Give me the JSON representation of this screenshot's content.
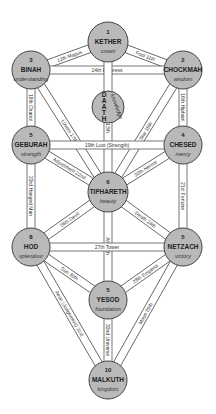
{
  "sephiroth": [
    {
      "id": "kether",
      "number": "1",
      "name": "KETHER",
      "quality": "crown",
      "cx": 108,
      "cy": 42,
      "r": 20
    },
    {
      "id": "chockmah",
      "number": "2",
      "name": "CHOCKMAH",
      "quality": "wisdom",
      "cx": 183,
      "cy": 70,
      "r": 19
    },
    {
      "id": "binah",
      "number": "3",
      "name": "BINAH",
      "quality": "understanding",
      "cx": 31,
      "cy": 70,
      "r": 19
    },
    {
      "id": "daath",
      "number": "",
      "name": "DAATH",
      "quality": "knowledge",
      "cx": 108,
      "cy": 107,
      "r": 16
    },
    {
      "id": "chesed",
      "number": "4",
      "name": "CHESED",
      "quality": "mercy",
      "cx": 183,
      "cy": 145,
      "r": 19
    },
    {
      "id": "geburah",
      "number": "5",
      "name": "GEBURAH",
      "quality": "strength",
      "cx": 31,
      "cy": 145,
      "r": 19
    },
    {
      "id": "tiphareth",
      "number": "6",
      "name": "TIPHARETH",
      "quality": "beauty",
      "cx": 108,
      "cy": 192,
      "r": 20
    },
    {
      "id": "hod",
      "number": "8",
      "name": "HOD",
      "quality": "splendour",
      "cx": 31,
      "cy": 247,
      "r": 19
    },
    {
      "id": "netzach",
      "number": "5",
      "name": "NETZACH",
      "quality": "victory",
      "cx": 183,
      "cy": 247,
      "r": 19
    },
    {
      "id": "yesod",
      "number": "5",
      "name": "YESOD",
      "quality": "foundation",
      "cx": 108,
      "cy": 300,
      "r": 19
    },
    {
      "id": "malkuth",
      "number": "10",
      "name": "MALKUTH",
      "quality": "kingdom",
      "cx": 108,
      "cy": 380,
      "r": 19
    }
  ],
  "paths": [
    {
      "from": "kether",
      "to": "binah",
      "label": "12th  Magus"
    },
    {
      "from": "kether",
      "to": "chockmah",
      "label": "Fool  11th"
    },
    {
      "from": "binah",
      "to": "chockmah",
      "label": "14th                    Empress"
    },
    {
      "from": "kether",
      "to": "tiphareth",
      "label": "Priestess  13th"
    },
    {
      "from": "binah",
      "to": "geburah",
      "label": "18th Chariot"
    },
    {
      "from": "binah",
      "to": "tiphareth",
      "label": "Lovers  17th"
    },
    {
      "from": "chockmah",
      "to": "tiphareth",
      "label": "Star  15th"
    },
    {
      "from": "chockmah",
      "to": "chesed",
      "label": "16th Hiphant"
    },
    {
      "from": "geburah",
      "to": "chesed",
      "label": "19th           Lust (Strength)"
    },
    {
      "from": "geburah",
      "to": "tiphareth",
      "label": "Adjustment 22nd"
    },
    {
      "from": "chesed",
      "to": "tiphareth",
      "label": "20th  Hermit"
    },
    {
      "from": "geburah",
      "to": "hod",
      "label": "23rd Hanged Man"
    },
    {
      "from": "chesed",
      "to": "netzach",
      "label": "21st  Fortune"
    },
    {
      "from": "hod",
      "to": "tiphareth",
      "label": "26th  Devil"
    },
    {
      "from": "netzach",
      "to": "tiphareth",
      "label": "Death  24th"
    },
    {
      "from": "tiphareth",
      "to": "yesod",
      "label": "Art  25th"
    },
    {
      "from": "hod",
      "to": "netzach",
      "label": "27th                    Tower"
    },
    {
      "from": "hod",
      "to": "yesod",
      "label": "Sun  30th"
    },
    {
      "from": "netzach",
      "to": "yesod",
      "label": "28th  Emperor"
    },
    {
      "from": "hod",
      "to": "malkuth",
      "label": "Aeon (Judgement)  31st"
    },
    {
      "from": "netzach",
      "to": "malkuth",
      "label": "Moon  29th"
    },
    {
      "from": "yesod",
      "to": "malkuth",
      "label": "32nd Universe"
    }
  ]
}
